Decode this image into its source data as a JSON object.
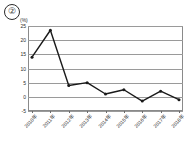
{
  "figure": {
    "marker_label": "②",
    "unit_label": "(%)"
  },
  "chart_data": {
    "type": "line",
    "title": "",
    "subtitle": "",
    "xlabel": "",
    "ylabel": "",
    "unit": "(%)",
    "categories": [
      "2010年",
      "2011年",
      "2012年",
      "2013年",
      "2014年",
      "2015年",
      "2016年",
      "2017年",
      "2018年"
    ],
    "values": [
      14.0,
      23.5,
      4.0,
      5.0,
      1.0,
      2.5,
      -1.5,
      2.0,
      -1.0
    ],
    "series": [
      {
        "name": "",
        "values": [
          14.0,
          23.5,
          4.0,
          5.0,
          1.0,
          2.5,
          -1.5,
          2.0,
          -1.0
        ]
      }
    ],
    "ylim": [
      -5,
      25
    ],
    "yticks": [
      25,
      20,
      15,
      10,
      5,
      0,
      -5
    ],
    "ytick_labels": [
      "25",
      "20",
      "15",
      "10",
      "5",
      "0",
      "-5"
    ],
    "grid": true,
    "legend": false,
    "legend_position": "none",
    "line_color": "#1a1a1a",
    "marker_color": "#1a1a1a",
    "grid_color": "#9a9a9a",
    "background_color": "#ffffff"
  }
}
